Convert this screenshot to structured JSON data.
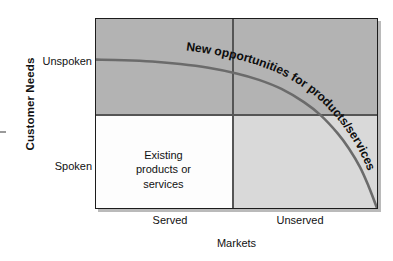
{
  "chart_data": {
    "type": "scatter",
    "title": "",
    "subtitle": "",
    "xlabel": "Markets",
    "ylabel": "Customer Needs",
    "x_tick_labels": [
      "Served",
      "Unserved"
    ],
    "y_tick_labels": [
      "Unspoken",
      "Spoken"
    ],
    "xlim": [
      0,
      1
    ],
    "ylim": [
      0,
      1
    ],
    "grid": false,
    "legend_position": "none",
    "quadrants": [
      {
        "name": "top-left",
        "label": "",
        "fill": "#b3b3b3"
      },
      {
        "name": "top-right",
        "label": "",
        "fill": "#b3b3b3"
      },
      {
        "name": "bottom-left",
        "label": "Existing products or services",
        "fill": "#fdfdfd"
      },
      {
        "name": "bottom-right",
        "label": "",
        "fill": "#d9d9d9"
      }
    ],
    "annotations": [
      {
        "text": "New opportunities for products/services",
        "placement": "along-curve",
        "style": "bold-italic-curved"
      }
    ],
    "series": [
      {
        "name": "opportunity frontier",
        "type": "line",
        "color": "#6b6b6b",
        "points": [
          {
            "x": 0.0,
            "y": 0.785
          },
          {
            "x": 0.1,
            "y": 0.782
          },
          {
            "x": 0.2,
            "y": 0.775
          },
          {
            "x": 0.3,
            "y": 0.762
          },
          {
            "x": 0.4,
            "y": 0.742
          },
          {
            "x": 0.5,
            "y": 0.712
          },
          {
            "x": 0.58,
            "y": 0.678
          },
          {
            "x": 0.66,
            "y": 0.63
          },
          {
            "x": 0.74,
            "y": 0.56
          },
          {
            "x": 0.8,
            "y": 0.49
          },
          {
            "x": 0.86,
            "y": 0.395
          },
          {
            "x": 0.9,
            "y": 0.315
          },
          {
            "x": 0.94,
            "y": 0.215
          },
          {
            "x": 0.97,
            "y": 0.115
          },
          {
            "x": 1.0,
            "y": 0.0
          }
        ]
      }
    ]
  },
  "axes": {
    "y_title": "Customer Needs",
    "x_title": "Markets",
    "y_ticks": {
      "unspoken": "Unspoken",
      "spoken": "Spoken"
    },
    "x_ticks": {
      "served": "Served",
      "unserved": "Unserved"
    }
  },
  "quadrant_text": {
    "existing": "Existing\nproducts or\nservices",
    "existing_line1": "Existing",
    "existing_line2": "products or",
    "existing_line3": "services"
  },
  "curve_annotation": {
    "text": "New opportunities for products/services"
  },
  "colors": {
    "quad_dark": "#b3b3b3",
    "quad_light": "#d9d9d9",
    "quad_white": "#fdfdfd",
    "curve": "#6b6b6b",
    "border": "#1c1c1c",
    "divider": "#555555",
    "text": "#111111"
  }
}
